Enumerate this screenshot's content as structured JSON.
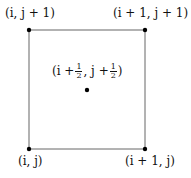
{
  "diagram": {
    "type": "grid-cell",
    "square": {
      "x1": 29,
      "y1": 30,
      "x2": 145,
      "y2": 149,
      "stroke": "#666666"
    },
    "points": [
      {
        "id": "top-left",
        "label": "(i, j + 1)",
        "x": 29,
        "y": 30
      },
      {
        "id": "top-right",
        "label": "(i + 1, j + 1)",
        "x": 145,
        "y": 30
      },
      {
        "id": "bottom-left",
        "label": "(i, j)",
        "x": 29,
        "y": 149
      },
      {
        "id": "bottom-right",
        "label": "(i + 1, j)",
        "x": 145,
        "y": 149
      },
      {
        "id": "center",
        "label": "(i + 1/2 , j + 1/2)",
        "x": 87,
        "y": 90
      }
    ]
  },
  "labels": {
    "top_left": "(i, j + 1)",
    "top_right": "(i + 1, j + 1)",
    "bottom_left": "(i, j)",
    "bottom_right": "(i + 1, j)",
    "center_open": "(i +",
    "center_mid": ", j +",
    "center_close": ")",
    "frac_num": "1",
    "frac_den": "2"
  }
}
